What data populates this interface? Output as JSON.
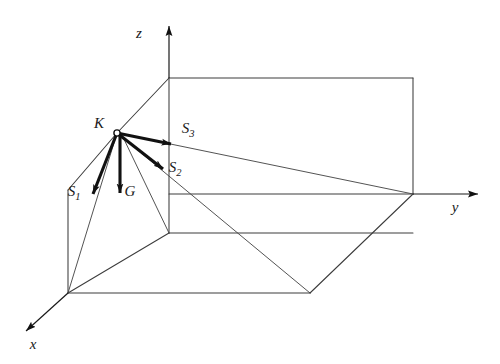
{
  "figure": {
    "background_color": "#ffffff",
    "line_color": "#3c3c3c",
    "vector_color": "#111111",
    "width": 500,
    "height": 364
  },
  "axes": [
    {
      "name": "z-axis",
      "label": "z",
      "direction": "up",
      "label_x": 139,
      "label_y": 38
    },
    {
      "name": "y-axis",
      "label": "y",
      "direction": "right",
      "label_x": 455,
      "label_y": 212
    },
    {
      "name": "x-axis",
      "label": "x",
      "direction": "down-left",
      "label_x": 33,
      "label_y": 349
    }
  ],
  "nodes": [
    {
      "name": "K",
      "label": "K",
      "label_x": 99,
      "label_y": 128,
      "x": 117,
      "y": 133
    }
  ],
  "vectors": [
    {
      "name": "S1",
      "label": "S",
      "subscript": "1",
      "label_x": 74,
      "label_y": 196,
      "from_x": 117,
      "from_y": 133,
      "to_x": 93,
      "to_y": 197
    },
    {
      "name": "G",
      "label": "G",
      "subscript": "",
      "label_x": 130,
      "label_y": 196,
      "from_x": 117,
      "from_y": 133,
      "to_x": 121,
      "to_y": 196
    },
    {
      "name": "S2",
      "label": "S",
      "subscript": "2",
      "label_x": 175,
      "label_y": 172,
      "from_x": 117,
      "from_y": 133,
      "to_x": 165,
      "to_y": 171
    },
    {
      "name": "S3",
      "label": "S",
      "subscript": "3",
      "label_x": 178,
      "label_y": 133,
      "from_x": 117,
      "from_y": 133,
      "to_x": 173,
      "to_y": 143
    }
  ],
  "geometry": {
    "description": "Wireframe rectangular box in oblique projection with diagonal bracing members meeting at node K",
    "vertices": {
      "origin": {
        "x": 169,
        "y": 194
      },
      "box_top_left": {
        "x": 169,
        "y": 78
      },
      "box_top_right": {
        "x": 413,
        "y": 78
      },
      "y_node": {
        "x": 413,
        "y": 194
      },
      "front_bottom": {
        "x": 68,
        "y": 293
      },
      "mid_floor": {
        "x": 169,
        "y": 233
      },
      "apex_bottom": {
        "x": 310,
        "y": 293
      },
      "node_K": {
        "x": 117,
        "y": 133
      }
    }
  }
}
